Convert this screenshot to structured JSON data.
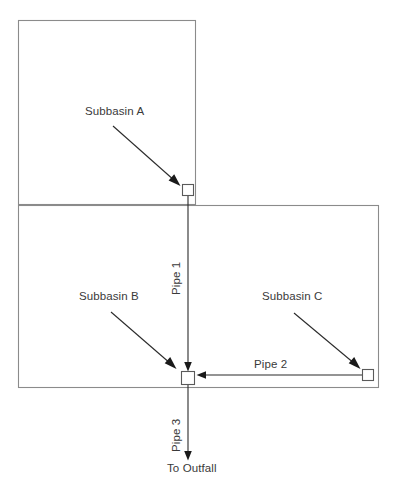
{
  "diagram": {
    "canvas": {
      "width": 397,
      "height": 495
    },
    "colors": {
      "basin_outline": "#8b8b8b",
      "pipe": "#2b2b2b",
      "junction_stroke": "#5a5a5a",
      "text": "#3a3a3a",
      "background": "#ffffff"
    },
    "basins": [
      {
        "id": "subbasin-a",
        "label": "Subbasin A",
        "rect": {
          "x": 18,
          "y": 20,
          "width": 178,
          "height": 185
        },
        "label_pos": {
          "x": 85,
          "y": 105
        }
      },
      {
        "id": "subbasin-b",
        "label": "Subbasin B",
        "rect": {
          "x": 18,
          "y": 205,
          "width": 361,
          "height": 183
        },
        "label_pos": {
          "x": 79,
          "y": 290
        }
      },
      {
        "id": "subbasin-c",
        "label": "Subbasin C",
        "label_pos": {
          "x": 262,
          "y": 290
        }
      }
    ],
    "junctions": [
      {
        "id": "junction-a",
        "x": 182,
        "y": 184,
        "size": 12
      },
      {
        "id": "junction-confluence",
        "x": 181,
        "y": 371,
        "size": 14
      },
      {
        "id": "junction-c",
        "x": 362,
        "y": 369,
        "size": 12
      }
    ],
    "pipes": [
      {
        "id": "pipe-1",
        "label": "Pipe 1",
        "orientation": "vertical",
        "direction": "down",
        "label_pos": {
          "x": 170,
          "y": 295
        },
        "from": {
          "x": 188,
          "y": 196
        },
        "to": {
          "x": 188,
          "y": 370
        }
      },
      {
        "id": "pipe-2",
        "label": "Pipe 2",
        "orientation": "horizontal",
        "direction": "left",
        "label_pos": {
          "x": 254,
          "y": 358
        },
        "from": {
          "x": 362,
          "y": 375
        },
        "to": {
          "x": 197,
          "y": 375
        }
      },
      {
        "id": "pipe-3",
        "label": "Pipe 3",
        "orientation": "vertical",
        "direction": "down",
        "label_pos": {
          "x": 170,
          "y": 452
        },
        "from": {
          "x": 188,
          "y": 385
        },
        "to": {
          "x": 188,
          "y": 460
        }
      }
    ],
    "outfall": {
      "id": "to-outfall",
      "label": "To Outfall",
      "label_pos": {
        "x": 167,
        "y": 462
      }
    },
    "leaders": [
      {
        "id": "leader-a",
        "from": {
          "x": 113,
          "y": 126
        },
        "to": {
          "x": 180,
          "y": 186
        }
      },
      {
        "id": "leader-b",
        "from": {
          "x": 111,
          "y": 312
        },
        "to": {
          "x": 176,
          "y": 369
        }
      },
      {
        "id": "leader-c",
        "from": {
          "x": 294,
          "y": 313
        },
        "to": {
          "x": 360,
          "y": 369
        }
      }
    ]
  }
}
